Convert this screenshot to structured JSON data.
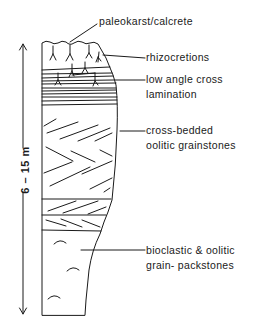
{
  "diagram": {
    "type": "stratigraphic-column",
    "scale": {
      "label": "6 – 15 m",
      "direction": "vertical-double-arrow"
    },
    "annotations": [
      {
        "id": "paleokarst",
        "lines": [
          "paleokarst/calcrete"
        ]
      },
      {
        "id": "rhizocretions",
        "lines": [
          "rhizocretions"
        ]
      },
      {
        "id": "low-angle",
        "lines": [
          "low angle cross",
          "lamination"
        ]
      },
      {
        "id": "cross-bedded",
        "lines": [
          "cross-bedded",
          "oolitic grainstones"
        ]
      },
      {
        "id": "bioclastic",
        "lines": [
          "bioclastic & oolitic",
          "grain- packstones"
        ]
      }
    ],
    "units_bottom_to_top": [
      "bioclastic & oolitic grain-packstones",
      "cross-bedded oolitic grainstones",
      "low angle cross lamination",
      "rhizocretions",
      "paleokarst/calcrete"
    ],
    "colors": {
      "ink": "#1a1a1a",
      "background": "#ffffff"
    }
  }
}
